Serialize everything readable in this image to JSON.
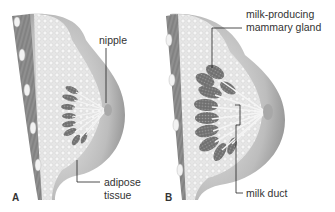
{
  "panels": [
    {
      "letter": "A",
      "labels": {
        "nipple": "nipple",
        "adipose_line1": "adipose",
        "adipose_line2": "tissue"
      }
    },
    {
      "letter": "B",
      "labels": {
        "gland_line1": "milk-producing",
        "gland_line2": "mammary gland",
        "duct": "milk duct"
      }
    }
  ],
  "colors": {
    "skin": "#c9c9c9",
    "skin_dark": "#9a9a9a",
    "fat": "#e4e4e4",
    "muscle": "#8a8a8a",
    "gland": "#6e6e6e",
    "line": "#222222"
  }
}
